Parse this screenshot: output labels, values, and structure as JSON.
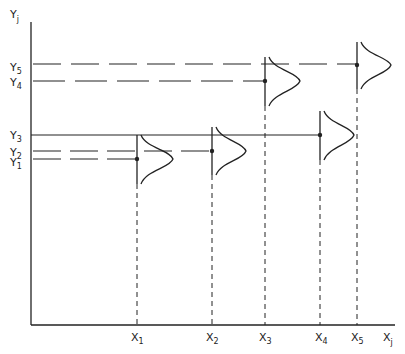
{
  "axes": {
    "y_label": "Y",
    "y_sub": "j",
    "x_label": "X",
    "x_sub": "j"
  },
  "y_levels": [
    {
      "label": "Y",
      "sub": "1",
      "y": 159,
      "style": "dashed"
    },
    {
      "label": "Y",
      "sub": "2",
      "y": 151,
      "style": "dashed"
    },
    {
      "label": "Y",
      "sub": "3",
      "y": 135,
      "style": "solid"
    },
    {
      "label": "Y",
      "sub": "4",
      "y": 81,
      "style": "dashed"
    },
    {
      "label": "Y",
      "sub": "5",
      "y": 64,
      "style": "dashed"
    }
  ],
  "x_points": [
    {
      "label": "X",
      "sub": "1",
      "x": 137
    },
    {
      "label": "X",
      "sub": "2",
      "x": 212
    },
    {
      "label": "X",
      "sub": "3",
      "x": 265
    },
    {
      "label": "X",
      "sub": "4",
      "x": 320
    },
    {
      "label": "X",
      "sub": "5",
      "x": 357
    }
  ],
  "distributions": [
    {
      "x": 137,
      "y": 159,
      "top": 135,
      "bottom": 184,
      "peak": 36
    },
    {
      "x": 212,
      "y": 151,
      "top": 127,
      "bottom": 175,
      "peak": 34
    },
    {
      "x": 265,
      "y": 81,
      "top": 57,
      "bottom": 106,
      "peak": 35
    },
    {
      "x": 320,
      "y": 135,
      "top": 111,
      "bottom": 160,
      "peak": 34
    },
    {
      "x": 357,
      "y": 65,
      "top": 42,
      "bottom": 89,
      "peak": 34
    }
  ],
  "colors": {
    "ink": "#222222",
    "background": "#ffffff"
  }
}
